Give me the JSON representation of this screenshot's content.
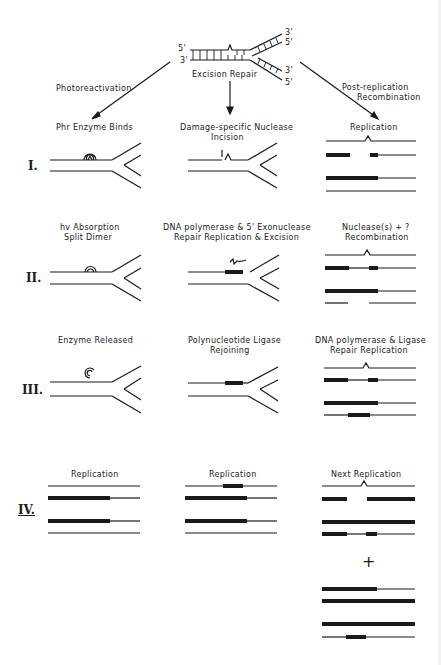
{
  "top": {
    "five_prime_1": "5'",
    "three_prime_1": "3'",
    "fork_3_upper": "3'",
    "fork_5_upper": "5'",
    "fork_3_lower": "3'",
    "fork_5_lower": "5'",
    "center_label": "Excision Repair"
  },
  "pathways": {
    "left": "Photoreactivation",
    "right_line1": "Post-replication",
    "right_line2": "Recombination"
  },
  "rows": [
    {
      "numeral": "I.",
      "left": [
        "Phr Enzyme Binds"
      ],
      "center": [
        "Damage-specific Nuclease",
        "Incision"
      ],
      "right": [
        "Replication"
      ]
    },
    {
      "numeral": "II.",
      "left": [
        "hv  Absorption",
        "Split Dimer"
      ],
      "center": [
        "DNA polymerase & 5' Exonuclease",
        "Repair Replication & Excision"
      ],
      "right": [
        "Nuclease(s) + ?",
        "Recombination"
      ]
    },
    {
      "numeral": "III.",
      "left": [
        "Enzyme Released"
      ],
      "center": [
        "Polynucleotide Ligase",
        "Rejoining"
      ],
      "right": [
        "DNA polymerase & Ligase",
        "Repair Replication"
      ]
    },
    {
      "numeral": "IV.",
      "left": [
        "Replication"
      ],
      "center": [
        "Replication"
      ],
      "right": [
        "Next Replication"
      ]
    }
  ],
  "plus_sign": "+"
}
